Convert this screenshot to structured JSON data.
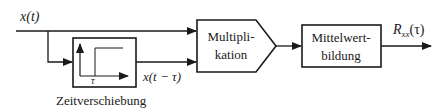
{
  "diagram": {
    "type": "block-diagram",
    "title": "",
    "input_signal": {
      "label": "x(t)"
    },
    "delay_block": {
      "caption": "Zeitverschiebung",
      "inner_axis_label": "τ",
      "output_label": "x(t − τ)"
    },
    "multiplier_block": {
      "line1": "Multipli-",
      "line2": "kation"
    },
    "averaging_block": {
      "line1": "Mittelwert-",
      "line2": "bildung"
    },
    "output_signal": {
      "label_main": "R",
      "label_sub": "xx",
      "label_arg": "(τ)"
    },
    "colors": {
      "stroke": "#1a1a1a",
      "background": "#ffffff"
    }
  }
}
